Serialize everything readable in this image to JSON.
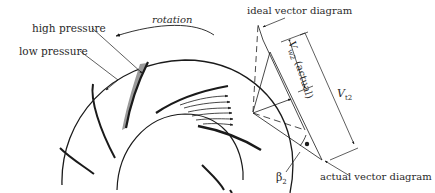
{
  "labels": {
    "high_pressure": "high pressure",
    "low_pressure": "low pressure",
    "rotation": "rotation",
    "ideal_vector_diagram": "ideal vector diagram",
    "actual_vector_diagram": "actual vector diagram",
    "v_w2_actual": "V w2 (actual)",
    "v_w2_main": "V",
    "v_w2_sub": "w2",
    "v_w2_suffix": "(actual)",
    "v_t2_main": "V",
    "v_t2_sub": "t2",
    "beta_main": "β",
    "beta_sub": "2"
  },
  "colors": {
    "ink": "#1a1a1a",
    "shade": "#9a9a9a",
    "background": "#ffffff"
  }
}
